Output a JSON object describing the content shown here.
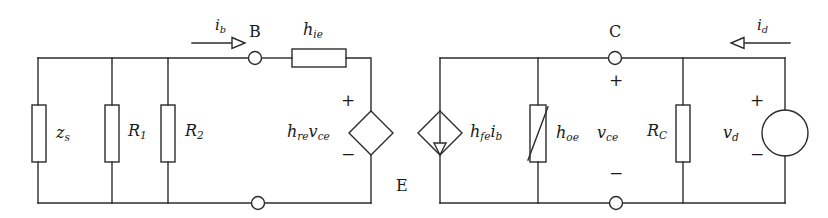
{
  "diagram": {
    "type": "circuit-schematic",
    "line_color": "#2b2b2b",
    "background": "#ffffff"
  },
  "nodes": [
    {
      "name": "node-b",
      "label": "B",
      "x": 255,
      "y": 58
    },
    {
      "name": "node-e",
      "label": "E",
      "x": 258,
      "y": 203
    },
    {
      "name": "node-c",
      "label": "C",
      "x": 615,
      "y": 58
    },
    {
      "name": "node-e2",
      "label": "",
      "x": 616,
      "y": 203
    }
  ],
  "labels": {
    "node_b": "B",
    "node_c": "C",
    "node_e": "E",
    "zs": "z",
    "zs_sub": "s",
    "r1": "R",
    "r1_sub": "1",
    "r2": "R",
    "r2_sub": "2",
    "hie": "h",
    "hie_sub": "ie",
    "hre_v": "h",
    "hre_sub": "re",
    "hre_v2": "v",
    "hre_v2_sub": "ce",
    "hfe_i": "h",
    "hfe_sub": "fe",
    "hfe_i2": "i",
    "hfe_i2_sub": "b",
    "hoe": "h",
    "hoe_sub": "oe",
    "vce": "v",
    "vce_sub": "ce",
    "rc": "R",
    "rc_sub": "C",
    "vd": "v",
    "vd_sub": "d",
    "ib": "i",
    "ib_sub": "b",
    "id": "i",
    "id_sub": "d",
    "plus": "+",
    "minus": "−"
  },
  "components": [
    {
      "name": "impedance-zs",
      "label": "z_s",
      "kind": "resistor",
      "orientation": "vertical",
      "x": 39,
      "y": 133
    },
    {
      "name": "resistor-r1",
      "label": "R_1",
      "kind": "resistor",
      "orientation": "vertical",
      "x": 112,
      "y": 133
    },
    {
      "name": "resistor-r2",
      "label": "R_2",
      "kind": "resistor",
      "orientation": "vertical",
      "x": 168,
      "y": 133
    },
    {
      "name": "resistor-hie",
      "label": "h_ie",
      "kind": "resistor",
      "orientation": "horizontal",
      "x": 319,
      "y": 58
    },
    {
      "name": "vcvs-hre-vce",
      "label": "h_re v_ce",
      "kind": "dependent-voltage-source",
      "x": 371,
      "y": 133
    },
    {
      "name": "cccs-hfe-ib",
      "label": "h_fe i_b",
      "kind": "dependent-current-source",
      "x": 440,
      "y": 133
    },
    {
      "name": "conductance-hoe",
      "label": "h_oe",
      "kind": "variable-resistor",
      "orientation": "vertical",
      "x": 538,
      "y": 133
    },
    {
      "name": "resistor-rc",
      "label": "R_C",
      "kind": "resistor",
      "orientation": "vertical",
      "x": 683,
      "y": 133
    },
    {
      "name": "source-vd",
      "label": "v_d",
      "kind": "independent-voltage-source",
      "x": 785,
      "y": 133
    }
  ],
  "currents": [
    {
      "name": "current-ib",
      "label": "i_b",
      "direction": "right",
      "x": 215,
      "y": 40
    },
    {
      "name": "current-id",
      "label": "i_d",
      "direction": "left",
      "x": 750,
      "y": 40
    }
  ],
  "polarities": [
    {
      "name": "polarity-hre-plus",
      "sign": "+",
      "x": 348,
      "y": 100
    },
    {
      "name": "polarity-hre-minus",
      "sign": "−",
      "x": 348,
      "y": 155
    },
    {
      "name": "polarity-vce-plus",
      "sign": "+",
      "x": 609,
      "y": 79
    },
    {
      "name": "polarity-vce-minus",
      "sign": "−",
      "x": 609,
      "y": 172
    },
    {
      "name": "polarity-vd-plus",
      "sign": "+",
      "x": 756,
      "y": 100
    },
    {
      "name": "polarity-vd-minus",
      "sign": "−",
      "x": 756,
      "y": 155
    }
  ]
}
